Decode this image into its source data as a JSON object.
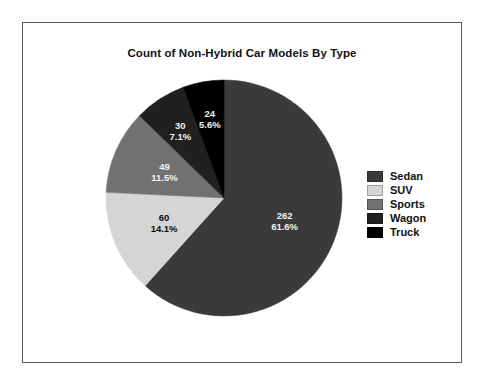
{
  "chart_data": {
    "type": "pie",
    "title": "Count of Non-Hybrid Car Models By Type",
    "xlabel": "",
    "ylabel": "",
    "total": 425,
    "legend_position": "right",
    "grid": false,
    "start_angle_deg": 0,
    "direction": "clockwise",
    "categories": [
      "Sedan",
      "SUV",
      "Sports",
      "Wagon",
      "Truck"
    ],
    "values": [
      262,
      60,
      49,
      30,
      24
    ],
    "percents": [
      "61.6%",
      "14.1%",
      "11.5%",
      "7.1%",
      "5.6%"
    ],
    "colors": [
      "#3a3a3a",
      "#d5d5d5",
      "#717171",
      "#202020",
      "#000000"
    ],
    "label_text_colors": [
      "#f2f2f2",
      "#0a0a0a",
      "#f2f2f2",
      "#f2f2f2",
      "#f2f2f2"
    ],
    "slices": [
      {
        "name": "Sedan",
        "value": 262,
        "percent": "61.6%",
        "color": "#3a3a3a",
        "label_color": "light"
      },
      {
        "name": "SUV",
        "value": 60,
        "percent": "14.1%",
        "color": "#d5d5d5",
        "label_color": "dark"
      },
      {
        "name": "Sports",
        "value": 49,
        "percent": "11.5%",
        "color": "#717171",
        "label_color": "light"
      },
      {
        "name": "Wagon",
        "value": 30,
        "percent": "7.1%",
        "color": "#202020",
        "label_color": "light"
      },
      {
        "name": "Truck",
        "value": 24,
        "percent": "5.6%",
        "color": "#000000",
        "label_color": "light"
      }
    ]
  },
  "title": "Count of Non-Hybrid Car Models By Type",
  "legend": {
    "items": [
      {
        "label": "Sedan",
        "color": "#3a3a3a"
      },
      {
        "label": "SUV",
        "color": "#d5d5d5"
      },
      {
        "label": "Sports",
        "color": "#717171"
      },
      {
        "label": "Wagon",
        "color": "#202020"
      },
      {
        "label": "Truck",
        "color": "#000000"
      }
    ]
  }
}
